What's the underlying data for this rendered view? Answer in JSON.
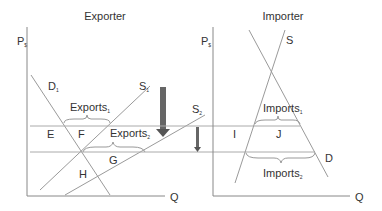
{
  "exporter": {
    "title": "Exporter",
    "y_axis": "P",
    "y_axis_sub": "$",
    "x_axis": "Q",
    "curves": {
      "demand": {
        "label": "D",
        "sub": "1"
      },
      "supply1": {
        "label": "S",
        "sub": "1"
      },
      "supply2": {
        "label": "S",
        "sub": "2"
      }
    },
    "brackets": {
      "exports1": {
        "label": "Exports",
        "sub": "1"
      },
      "exports2": {
        "label": "Exports",
        "sub": "2"
      }
    },
    "areas": [
      "E",
      "F",
      "G",
      "H"
    ]
  },
  "importer": {
    "title": "Importer",
    "y_axis": "P",
    "y_axis_sub": "$",
    "x_axis": "Q",
    "curves": {
      "supply": {
        "label": "S"
      },
      "demand": {
        "label": "D"
      }
    },
    "brackets": {
      "imports1": {
        "label": "Imports",
        "sub": "1"
      },
      "imports2": {
        "label": "Imports",
        "sub": "2"
      }
    },
    "areas": [
      "I",
      "J"
    ]
  },
  "colors": {
    "axis": "#888888",
    "line": "#9a9a9a",
    "arrow": "#555555",
    "text": "#333333"
  }
}
